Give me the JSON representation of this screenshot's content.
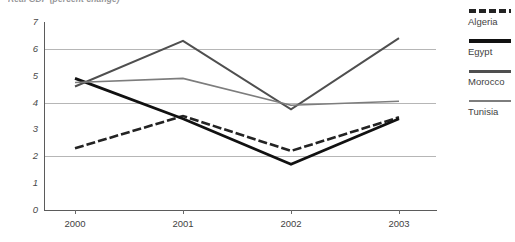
{
  "chart_data": {
    "type": "line",
    "title": "Real GDP (percent change)",
    "xlabel": "",
    "ylabel": "",
    "x": [
      "2000",
      "2001",
      "2002",
      "2003"
    ],
    "categories": [
      "2000",
      "2001",
      "2002",
      "2003"
    ],
    "ylim": [
      0,
      7
    ],
    "yticks": [
      0,
      1,
      2,
      3,
      4,
      5,
      6,
      7
    ],
    "ytick_labels": [
      "0",
      "1",
      "2",
      "3",
      "4",
      "5",
      "6",
      "7"
    ],
    "gridlines": [
      2,
      4,
      6
    ],
    "grid": true,
    "legend_position": "right",
    "series": [
      {
        "name": "Algeria",
        "values": [
          2.3,
          3.5,
          2.2,
          3.45
        ],
        "style": "dashed",
        "color": "#232323",
        "width": 2.6
      },
      {
        "name": "Egypt",
        "values": [
          4.9,
          3.4,
          1.7,
          3.4
        ],
        "style": "solid",
        "color": "#111111",
        "width": 2.8
      },
      {
        "name": "Morocco",
        "values": [
          4.6,
          6.3,
          3.75,
          6.4
        ],
        "style": "solid",
        "color": "#4f4f4f",
        "width": 2.0
      },
      {
        "name": "Tunisia",
        "values": [
          4.75,
          4.9,
          3.9,
          4.05
        ],
        "style": "solid",
        "color": "#7d7d7d",
        "width": 1.6
      }
    ]
  },
  "legend": {
    "items": [
      {
        "label": "Algeria"
      },
      {
        "label": "Egypt"
      },
      {
        "label": "Morocco"
      },
      {
        "label": "Tunisia"
      }
    ]
  },
  "axes": {
    "y_labels": [
      "7",
      "6",
      "5",
      "4",
      "3",
      "2",
      "1",
      "0"
    ],
    "x_labels": [
      "2000",
      "2001",
      "2002",
      "2003"
    ]
  }
}
